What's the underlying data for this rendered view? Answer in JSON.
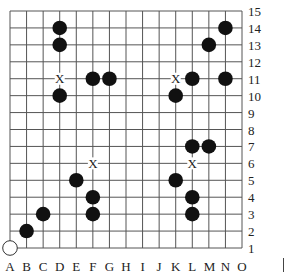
{
  "board": {
    "size": 15,
    "columns": [
      "A",
      "B",
      "C",
      "D",
      "E",
      "F",
      "G",
      "H",
      "I",
      "J",
      "K",
      "L",
      "M",
      "N",
      "O"
    ],
    "rows": [
      "1",
      "2",
      "3",
      "4",
      "5",
      "6",
      "7",
      "8",
      "9",
      "10",
      "11",
      "12",
      "13",
      "14",
      "15"
    ],
    "black_stones": [
      "D14",
      "D13",
      "D10",
      "F11",
      "G11",
      "K10",
      "L11",
      "M13",
      "N14",
      "N11",
      "L7",
      "M7",
      "E5",
      "F4",
      "F3",
      "K5",
      "L4",
      "L3",
      "C3",
      "B2"
    ],
    "white_stones": [
      "A1"
    ],
    "x_marks": [
      "D11",
      "K11",
      "F6",
      "L6"
    ],
    "colors": {
      "line": "#555555",
      "black_stone": "#111111",
      "white_stone": "#ffffff",
      "mark": "#222222"
    }
  }
}
